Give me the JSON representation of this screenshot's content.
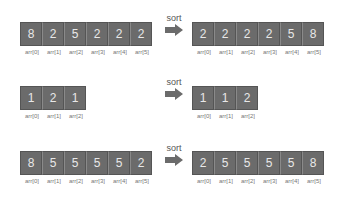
{
  "sort_label": "sort",
  "rows": [
    {
      "before": {
        "values": [
          "8",
          "2",
          "5",
          "2",
          "2",
          "2"
        ],
        "labels": [
          "arr[0]",
          "arr[1]",
          "arr[2]",
          "arr[3]",
          "arr[4]",
          "arr[5]"
        ]
      },
      "after": {
        "values": [
          "2",
          "2",
          "2",
          "2",
          "5",
          "8"
        ],
        "labels": [
          "arr[0]",
          "arr[1]",
          "arr[2]",
          "arr[3]",
          "arr[4]",
          "arr[5]"
        ]
      }
    },
    {
      "before": {
        "values": [
          "1",
          "2",
          "1"
        ],
        "labels": [
          "arr[0]",
          "arr[1]",
          "arr[2]"
        ]
      },
      "after": {
        "values": [
          "1",
          "1",
          "2"
        ],
        "labels": [
          "arr[0]",
          "arr[1]",
          "arr[2]"
        ]
      }
    },
    {
      "before": {
        "values": [
          "8",
          "5",
          "5",
          "5",
          "5",
          "2"
        ],
        "labels": [
          "arr[0]",
          "arr[1]",
          "arr[2]",
          "arr[3]",
          "arr[4]",
          "arr[5]"
        ]
      },
      "after": {
        "values": [
          "2",
          "5",
          "5",
          "5",
          "5",
          "8"
        ],
        "labels": [
          "arr[0]",
          "arr[1]",
          "arr[2]",
          "arr[3]",
          "arr[4]",
          "arr[5]"
        ]
      }
    }
  ],
  "colors": {
    "cell": "#6b6b6b",
    "cell_text": "#e8e8e8",
    "label": "#777777",
    "arrow": "#6b6b6b"
  }
}
